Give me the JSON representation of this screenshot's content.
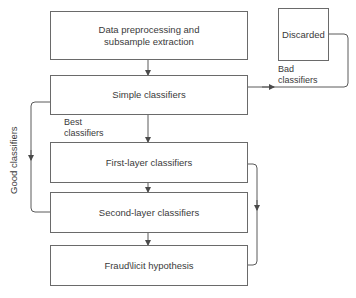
{
  "diagram": {
    "nodes": {
      "preprocessing": {
        "line1": "Data preprocessing and",
        "line2": "subsample extraction"
      },
      "simple": "Simple classifiers",
      "first_layer": "First-layer classifiers",
      "second_layer": "Second-layer classifiers",
      "hypothesis": "Fraud\\licit hypothesis",
      "discarded": "Discarded"
    },
    "edge_labels": {
      "bad": {
        "line1": "Bad",
        "line2": "classifiers"
      },
      "best": {
        "line1": "Best",
        "line2": "classifiers"
      },
      "good": "Good classifiers"
    },
    "colors": {
      "line": "#5a5a5a",
      "text": "#3a3a3a",
      "border": "#6a6a6a"
    }
  }
}
